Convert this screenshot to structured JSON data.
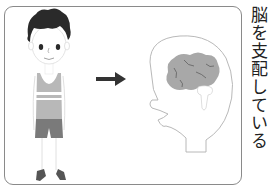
{
  "caption": {
    "text": "脳を支配している",
    "orientation": "vertical"
  },
  "illustration": {
    "left_figure": "boy-standing",
    "middle": "arrow-right-icon",
    "right_figure": "head-profile-with-brain",
    "colors": {
      "hair": "#2a2a2a",
      "skin_outline": "#9a9a9a",
      "shirt": "#b8b8b8",
      "shirt_stripe": "#ffffff",
      "shorts": "#7a7a7a",
      "shoes": "#555555",
      "arrow": "#333333",
      "brain": "#a8a8a8",
      "brain_folds": "#555555",
      "head_outline": "#b0b0b0",
      "frame": "#8a8a8a"
    }
  }
}
